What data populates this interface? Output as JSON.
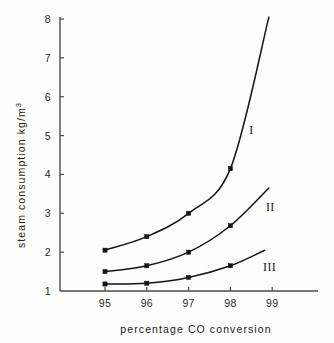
{
  "chart_data": {
    "type": "line",
    "title": "",
    "xlabel": "percentage  CO  conversion",
    "ylabel": "steam  consumption",
    "ylabel_units": "kg/m",
    "ylabel_units_sup": "3",
    "x": [
      95,
      96,
      97,
      98
    ],
    "xticks": [
      "95",
      "96",
      "97",
      "98",
      "99"
    ],
    "xtick_values": [
      95,
      96,
      97,
      98,
      99
    ],
    "yticks": [
      "1",
      "2",
      "3",
      "4",
      "5",
      "6",
      "7",
      "8"
    ],
    "ytick_values": [
      1,
      2,
      3,
      4,
      5,
      6,
      7,
      8
    ],
    "xlim": [
      94.6,
      99.6
    ],
    "ylim": [
      1,
      8
    ],
    "grid": false,
    "legend": "inline-curve-labels",
    "series": [
      {
        "name": "I",
        "label": "I",
        "label_x": 98.45,
        "label_y": 5.05,
        "values": [
          2.05,
          2.4,
          3.0,
          4.15
        ],
        "end_x": 98.92,
        "end_y": 8.05,
        "color": "#141414"
      },
      {
        "name": "II",
        "label": "II",
        "label_x": 98.85,
        "label_y": 3.05,
        "values": [
          1.5,
          1.65,
          2.0,
          2.68
        ],
        "end_x": 98.92,
        "end_y": 3.65,
        "color": "#141414"
      },
      {
        "name": "III",
        "label": "III",
        "label_x": 98.78,
        "label_y": 1.52,
        "values": [
          1.18,
          1.2,
          1.35,
          1.65
        ],
        "end_x": 98.82,
        "end_y": 2.05,
        "color": "#141414"
      }
    ]
  }
}
